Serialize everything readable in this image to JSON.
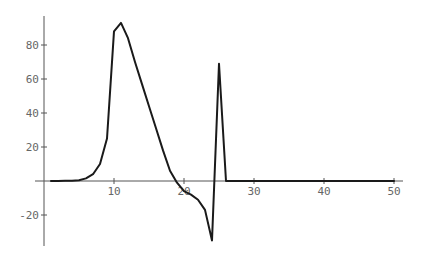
{
  "chart_data": {
    "type": "line",
    "title": "",
    "xlabel": "",
    "ylabel": "",
    "xlim": [
      0,
      51.5
    ],
    "ylim": [
      -38,
      97
    ],
    "grid": false,
    "legend": null,
    "x_ticks": [
      10,
      20,
      30,
      40,
      50
    ],
    "x_tick_labels": [
      "10",
      "20",
      "30",
      "40",
      "50"
    ],
    "y_ticks": [
      -20,
      20,
      40,
      60,
      80
    ],
    "y_tick_labels": [
      "-20",
      "20",
      "40",
      "60",
      "80"
    ],
    "series": [
      {
        "name": "series-1",
        "color": "#1a1a1a",
        "x": [
          1,
          2,
          3,
          4,
          5,
          6,
          7,
          8,
          9,
          10,
          11,
          12,
          13,
          14,
          15,
          16,
          17,
          18,
          19,
          20,
          21,
          22,
          23,
          24,
          25,
          26,
          27,
          28,
          29,
          30,
          31,
          32,
          33,
          34,
          35,
          36,
          37,
          38,
          39,
          40,
          41,
          42,
          43,
          44,
          45,
          46,
          47,
          48,
          49,
          50
        ],
        "y": [
          0,
          0,
          0.1,
          0.2,
          0.5,
          1.5,
          4,
          10,
          25,
          88,
          93,
          84,
          70,
          57,
          44,
          31,
          18,
          6,
          -1,
          -6,
          -8,
          -11,
          -17,
          -35,
          69,
          0,
          0,
          0,
          0,
          0,
          0,
          0,
          0,
          0,
          0,
          0,
          0,
          0,
          0,
          0,
          0,
          0,
          0,
          0,
          0,
          0,
          0,
          0,
          0,
          0
        ]
      }
    ]
  },
  "layout": {
    "x_origin_px": 44,
    "x_scale_px": 7,
    "y_origin_px": 181,
    "y_scale_px": 1.7,
    "x_axis_extent_px": [
      35,
      403
    ],
    "y_axis_extent_px": [
      16,
      246
    ]
  }
}
